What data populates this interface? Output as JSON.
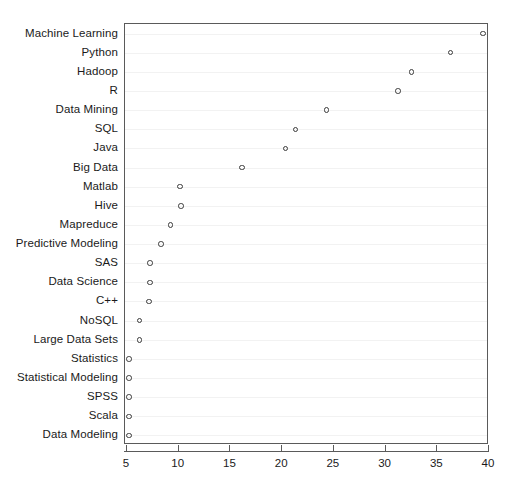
{
  "chart_data": {
    "type": "scatter",
    "title": "",
    "subtitle": "",
    "xlabel": "",
    "ylabel": "",
    "orientation": "horizontal",
    "marker": "open-circle",
    "grid": "horizontal-only",
    "legend": "none",
    "xlim": [
      4.8,
      40.0
    ],
    "xticks": [
      5,
      10,
      15,
      20,
      25,
      30,
      35,
      40
    ],
    "xtick_labels": [
      "5",
      "10",
      "15",
      "20",
      "25",
      "30",
      "35",
      "40"
    ],
    "categories": [
      "Machine Learning",
      "Python",
      "Hadoop",
      "R",
      "Data Mining",
      "SQL",
      "Java",
      "Big Data",
      "Matlab",
      "Hive",
      "Mapreduce",
      "Predictive Modeling",
      "SAS",
      "Data Science",
      "C++",
      "NoSQL",
      "Large Data Sets",
      "Statistics",
      "Statistical Modeling",
      "SPSS",
      "Scala",
      "Data Modeling"
    ],
    "values": [
      39.4,
      36.3,
      32.5,
      31.2,
      24.3,
      21.3,
      20.3,
      16.1,
      10.1,
      10.2,
      9.2,
      8.3,
      7.2,
      7.2,
      7.1,
      6.2,
      6.2,
      5.2,
      5.2,
      5.2,
      5.2,
      5.2
    ],
    "colors": {
      "marker_stroke": "#3c3c3c",
      "panel_border": "#5a5a5a",
      "gridline": "#f2f2f2",
      "text": "#1a1a1a",
      "background": "#ffffff"
    }
  }
}
